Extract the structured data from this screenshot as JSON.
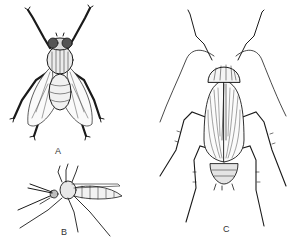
{
  "figure": {
    "panels": [
      {
        "id": "A",
        "label": "A",
        "subject": "housefly",
        "view": "dorsal"
      },
      {
        "id": "B",
        "label": "B",
        "subject": "mosquito",
        "view": "lateral"
      },
      {
        "id": "C",
        "label": "C",
        "subject": "cockroach",
        "view": "dorsal"
      }
    ],
    "colors": {
      "ink": "#1a1a1a",
      "background": "#ffffff"
    }
  }
}
